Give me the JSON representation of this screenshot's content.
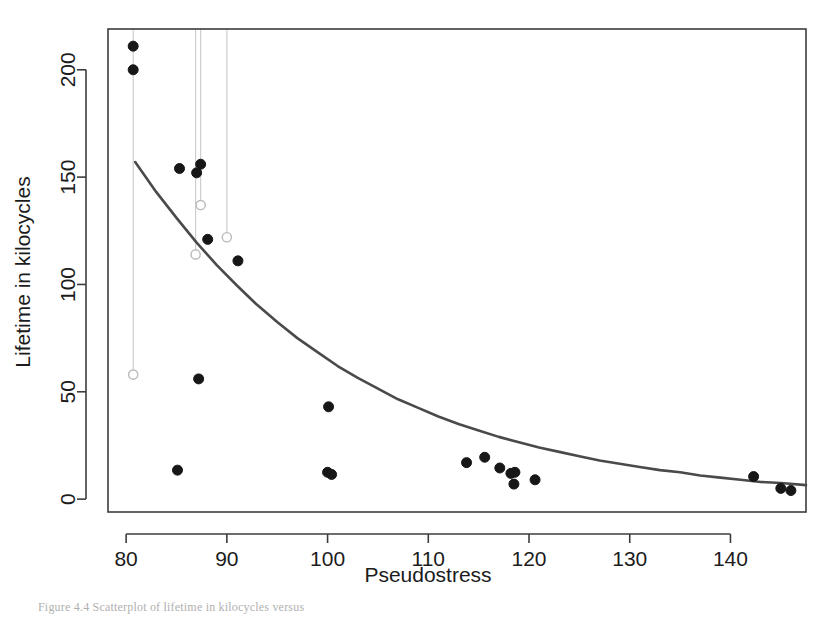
{
  "figure": {
    "background_color": "#ffffff",
    "frame_color": "#3c3c3c",
    "point_color": "#171717",
    "open_point_color": "#b9b9b9",
    "drop_line_color": "#c9c9c9",
    "curve_color": "#4a4a4a",
    "caption": "Figure 4.4  Scatterplot of lifetime in kilocycles versus"
  },
  "chart_data": {
    "type": "scatter",
    "title": "",
    "xlabel": "Pseudostress",
    "ylabel": "Lifetime in kilocycles",
    "xlim": [
      78.2,
      147.5
    ],
    "ylim": [
      -6,
      219
    ],
    "xticks": [
      80,
      90,
      100,
      110,
      120,
      130,
      140
    ],
    "yticks": [
      0,
      50,
      100,
      150,
      200
    ],
    "xtick_labels": [
      "80",
      "90",
      "100",
      "110",
      "120",
      "130",
      "140"
    ],
    "ytick_labels": [
      "0",
      "50",
      "100",
      "150",
      "200"
    ],
    "grid": false,
    "legend": null,
    "series": [
      {
        "name": "Observed lifetimes",
        "marker": "filled-circle",
        "color": "#171717",
        "points": [
          {
            "x": 80.7,
            "y": 211.0
          },
          {
            "x": 80.7,
            "y": 200.0
          },
          {
            "x": 85.3,
            "y": 154.0
          },
          {
            "x": 87.0,
            "y": 152.0
          },
          {
            "x": 87.4,
            "y": 156.0
          },
          {
            "x": 88.1,
            "y": 121.0
          },
          {
            "x": 91.1,
            "y": 111.0
          },
          {
            "x": 85.1,
            "y": 13.5
          },
          {
            "x": 87.2,
            "y": 56.0
          },
          {
            "x": 100.1,
            "y": 43.0
          },
          {
            "x": 100.0,
            "y": 12.5
          },
          {
            "x": 100.4,
            "y": 11.5
          },
          {
            "x": 113.8,
            "y": 17.0
          },
          {
            "x": 115.6,
            "y": 19.5
          },
          {
            "x": 117.1,
            "y": 14.5
          },
          {
            "x": 118.2,
            "y": 12.0
          },
          {
            "x": 118.6,
            "y": 12.5
          },
          {
            "x": 118.5,
            "y": 7.0
          },
          {
            "x": 120.6,
            "y": 9.0
          },
          {
            "x": 142.3,
            "y": 10.5
          },
          {
            "x": 145.0,
            "y": 5.0
          },
          {
            "x": 146.0,
            "y": 4.0
          }
        ]
      },
      {
        "name": "Censored / adjusted values",
        "marker": "open-circle",
        "color": "#b9b9b9",
        "points": [
          {
            "x": 80.7,
            "y": 58.0
          },
          {
            "x": 86.9,
            "y": 114.0
          },
          {
            "x": 87.4,
            "y": 137.0
          },
          {
            "x": 90.0,
            "y": 122.0
          }
        ]
      }
    ],
    "drop_lines": [
      {
        "x": 80.7,
        "y_top": 219.0,
        "y_bottom": 58.0
      },
      {
        "x": 86.9,
        "y_top": 219.0,
        "y_bottom": 114.0
      },
      {
        "x": 87.4,
        "y_top": 219.0,
        "y_bottom": 137.0
      },
      {
        "x": 90.0,
        "y_top": 219.0,
        "y_bottom": 122.0
      }
    ],
    "fitted_curve": {
      "name": "Fitted exponential decay",
      "color": "#4a4a4a",
      "x_start": 80.9,
      "x_end": 147.5,
      "points": [
        {
          "x": 80.9,
          "y": 157.0
        },
        {
          "x": 83.0,
          "y": 143.0
        },
        {
          "x": 85.0,
          "y": 131.0
        },
        {
          "x": 87.0,
          "y": 119.5
        },
        {
          "x": 89.0,
          "y": 109.0
        },
        {
          "x": 91.0,
          "y": 99.5
        },
        {
          "x": 93.0,
          "y": 90.5
        },
        {
          "x": 95.0,
          "y": 82.5
        },
        {
          "x": 97.0,
          "y": 75.0
        },
        {
          "x": 99.0,
          "y": 68.5
        },
        {
          "x": 101.0,
          "y": 62.0
        },
        {
          "x": 103.0,
          "y": 56.5
        },
        {
          "x": 105.0,
          "y": 51.5
        },
        {
          "x": 107.0,
          "y": 46.5
        },
        {
          "x": 109.0,
          "y": 42.5
        },
        {
          "x": 111.0,
          "y": 38.5
        },
        {
          "x": 113.0,
          "y": 35.0
        },
        {
          "x": 115.0,
          "y": 32.0
        },
        {
          "x": 117.0,
          "y": 29.0
        },
        {
          "x": 119.0,
          "y": 26.5
        },
        {
          "x": 121.0,
          "y": 24.0
        },
        {
          "x": 123.0,
          "y": 22.0
        },
        {
          "x": 125.0,
          "y": 20.0
        },
        {
          "x": 127.0,
          "y": 18.0
        },
        {
          "x": 129.0,
          "y": 16.5
        },
        {
          "x": 131.0,
          "y": 15.0
        },
        {
          "x": 133.0,
          "y": 13.5
        },
        {
          "x": 135.0,
          "y": 12.5
        },
        {
          "x": 137.0,
          "y": 11.0
        },
        {
          "x": 139.0,
          "y": 10.0
        },
        {
          "x": 141.0,
          "y": 9.0
        },
        {
          "x": 143.0,
          "y": 8.0
        },
        {
          "x": 145.0,
          "y": 7.5
        },
        {
          "x": 147.5,
          "y": 6.5
        }
      ]
    }
  }
}
